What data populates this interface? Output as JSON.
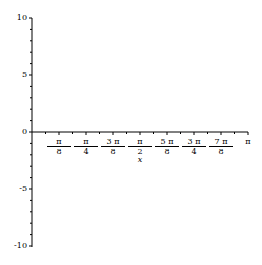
{
  "chart_data": {
    "type": "line",
    "title": "",
    "xlabel": "x",
    "ylabel": "",
    "xlim": [
      0,
      3.14159
    ],
    "ylim": [
      -10,
      10
    ],
    "grid": false,
    "legend": null,
    "series": [],
    "x_ticks": [
      {
        "num": "π",
        "den": "8"
      },
      {
        "num": "π",
        "den": "4"
      },
      {
        "num": "3 π",
        "den": "8"
      },
      {
        "num": "π",
        "den": "2"
      },
      {
        "num": "5 π",
        "den": "8"
      },
      {
        "num": "3 π",
        "den": "4"
      },
      {
        "num": "7 π",
        "den": "8"
      },
      {
        "num": "π",
        "den": ""
      }
    ],
    "y_ticks": [
      "10",
      "5",
      "0",
      "-5",
      "-10"
    ]
  }
}
